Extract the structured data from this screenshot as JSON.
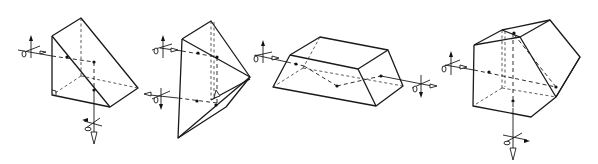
{
  "figure": {
    "type": "technical-line-drawing",
    "colors": {
      "line": "#1a1a1a",
      "background": "#ffffff"
    },
    "prisms": [
      {
        "name": "right-angle-prism",
        "reflections": 1,
        "input": "left",
        "output": "down"
      },
      {
        "name": "roof-prism",
        "reflections": 2,
        "input": "left",
        "output": "left"
      },
      {
        "name": "dove-prism",
        "reflections": 1,
        "input": "left",
        "output": "right"
      },
      {
        "name": "pentaprism",
        "reflections": 2,
        "input": "left",
        "output": "down"
      }
    ]
  }
}
